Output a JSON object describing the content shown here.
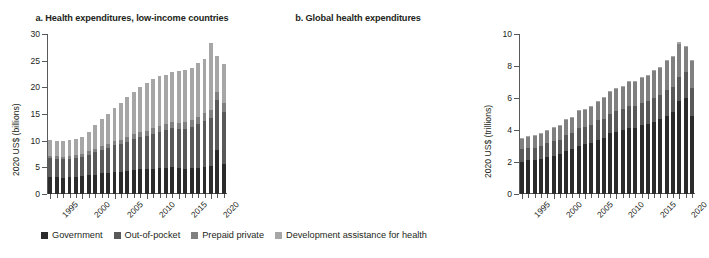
{
  "legend": {
    "items": [
      {
        "label": "Government",
        "color": "#2b2b2b"
      },
      {
        "label": "Out-of-pocket",
        "color": "#595959"
      },
      {
        "label": "Prepaid private",
        "color": "#808080"
      },
      {
        "label": "Development assistance for health",
        "color": "#a6a6a6"
      }
    ]
  },
  "chart_data": [
    {
      "type": "bar",
      "id": "panel-a",
      "title": "a. Health expenditures, low-income countries",
      "xlabel": "",
      "ylabel": "2020 US$ (billions)",
      "ylim": [
        0,
        30
      ],
      "yticks": [
        0,
        5,
        10,
        15,
        20,
        25,
        30
      ],
      "xlim": [
        1995,
        2022
      ],
      "xticks_major": [
        1995,
        2000,
        2005,
        2010,
        2015,
        2020
      ],
      "grid": false,
      "stacked": true,
      "legend_position": "bottom",
      "categories": [
        1995,
        1996,
        1997,
        1998,
        1999,
        2000,
        2001,
        2002,
        2003,
        2004,
        2005,
        2006,
        2007,
        2008,
        2009,
        2010,
        2011,
        2012,
        2013,
        2014,
        2015,
        2016,
        2017,
        2018,
        2019,
        2020,
        2021,
        2022
      ],
      "series": [
        {
          "name": "Government",
          "values": [
            3.1,
            3.1,
            3.0,
            3.1,
            3.2,
            3.3,
            3.5,
            3.6,
            3.9,
            4.0,
            4.2,
            4.2,
            4.3,
            4.5,
            4.6,
            4.6,
            4.7,
            4.8,
            4.9,
            5.0,
            4.8,
            4.7,
            4.8,
            4.9,
            5.1,
            5.2,
            8.2,
            5.6
          ]
        },
        {
          "name": "Out-of-pocket",
          "values": [
            3.6,
            3.5,
            3.5,
            3.5,
            3.6,
            3.7,
            3.9,
            4.2,
            4.4,
            4.7,
            5.0,
            5.2,
            5.5,
            5.9,
            6.1,
            6.3,
            6.6,
            6.9,
            7.1,
            7.3,
            7.4,
            7.5,
            7.8,
            8.2,
            8.6,
            9.0,
            9.4,
            9.8
          ]
        },
        {
          "name": "Prepaid private",
          "values": [
            0.5,
            0.5,
            0.5,
            0.5,
            0.5,
            0.5,
            0.6,
            0.6,
            0.7,
            0.7,
            0.8,
            0.8,
            0.9,
            0.9,
            1.0,
            1.0,
            1.1,
            1.1,
            1.2,
            1.2,
            1.2,
            1.3,
            1.3,
            1.4,
            1.4,
            1.5,
            1.5,
            1.6
          ]
        },
        {
          "name": "Development assistance for health",
          "values": [
            2.9,
            2.9,
            3.0,
            3.0,
            3.0,
            3.2,
            3.6,
            4.5,
            5.0,
            5.6,
            6.2,
            6.9,
            7.5,
            7.9,
            8.3,
            9.0,
            9.1,
            9.3,
            9.1,
            9.3,
            9.7,
            9.8,
            9.8,
            10.1,
            10.3,
            12.6,
            6.7,
            7.3
          ]
        }
      ],
      "totals": [
        10.1,
        10.0,
        10.0,
        10.1,
        10.3,
        10.7,
        11.6,
        12.9,
        14.0,
        15.0,
        16.2,
        17.1,
        18.2,
        19.2,
        20.0,
        20.9,
        21.5,
        22.1,
        22.3,
        22.8,
        23.1,
        23.3,
        23.7,
        24.6,
        25.4,
        28.3,
        25.8,
        24.3
      ]
    },
    {
      "type": "bar",
      "id": "panel-b",
      "title": "b. Global health expenditures",
      "xlabel": "",
      "ylabel": "2020 US$ (trillions)",
      "ylim": [
        0,
        10
      ],
      "yticks": [
        0,
        2,
        4,
        6,
        8,
        10
      ],
      "xlim": [
        1995,
        2022
      ],
      "xticks_major": [
        1995,
        2000,
        2005,
        2010,
        2015,
        2020
      ],
      "grid": false,
      "stacked": true,
      "legend_position": "bottom",
      "categories": [
        1995,
        1996,
        1997,
        1998,
        1999,
        2000,
        2001,
        2002,
        2003,
        2004,
        2005,
        2006,
        2007,
        2008,
        2009,
        2010,
        2011,
        2012,
        2013,
        2014,
        2015,
        2016,
        2017,
        2018,
        2019,
        2020,
        2021,
        2022
      ],
      "series": [
        {
          "name": "Government",
          "values": [
            2.0,
            2.1,
            2.1,
            2.2,
            2.3,
            2.4,
            2.5,
            2.7,
            2.8,
            3.0,
            3.1,
            3.2,
            3.4,
            3.5,
            3.8,
            3.9,
            4.0,
            4.1,
            4.1,
            4.3,
            4.4,
            4.5,
            4.7,
            4.9,
            5.1,
            5.8,
            6.0,
            4.9
          ]
        },
        {
          "name": "Out-of-pocket",
          "values": [
            0.8,
            0.8,
            0.8,
            0.8,
            0.9,
            0.9,
            0.9,
            1.0,
            1.0,
            1.1,
            1.1,
            1.1,
            1.2,
            1.2,
            1.2,
            1.3,
            1.3,
            1.4,
            1.4,
            1.4,
            1.4,
            1.5,
            1.5,
            1.6,
            1.6,
            1.5,
            1.6,
            1.7
          ]
        },
        {
          "name": "Prepaid private",
          "values": [
            0.7,
            0.7,
            0.8,
            0.8,
            0.8,
            0.9,
            0.9,
            1.0,
            1.0,
            1.1,
            1.1,
            1.2,
            1.2,
            1.3,
            1.4,
            1.4,
            1.4,
            1.5,
            1.5,
            1.6,
            1.6,
            1.7,
            1.7,
            1.8,
            1.9,
            2.1,
            1.6,
            1.7
          ]
        },
        {
          "name": "Development assistance for health",
          "values": [
            0.01,
            0.01,
            0.01,
            0.01,
            0.01,
            0.02,
            0.02,
            0.02,
            0.02,
            0.03,
            0.03,
            0.03,
            0.03,
            0.04,
            0.04,
            0.04,
            0.04,
            0.04,
            0.04,
            0.04,
            0.05,
            0.05,
            0.05,
            0.05,
            0.05,
            0.08,
            0.05,
            0.05
          ]
        }
      ],
      "totals": [
        3.5,
        3.6,
        3.7,
        3.8,
        4.0,
        4.2,
        4.3,
        4.7,
        4.8,
        5.2,
        5.3,
        5.5,
        5.8,
        6.1,
        6.4,
        6.6,
        6.7,
        7.0,
        7.1,
        7.3,
        7.5,
        7.7,
        8.0,
        8.4,
        8.7,
        9.5,
        9.2,
        8.4
      ]
    }
  ]
}
